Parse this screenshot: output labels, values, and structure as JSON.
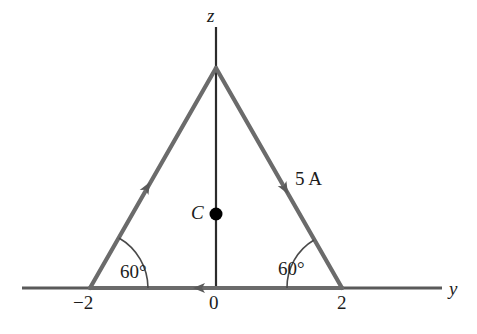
{
  "figure": {
    "background_color": "#ffffff",
    "axes": {
      "vertical": {
        "label": "z",
        "color": "#2b2b2b",
        "x_px": 216,
        "y_top_px": 27,
        "y_bottom_px": 288,
        "width_px": 2
      },
      "horizontal": {
        "label": "y",
        "color": "#5a5a5a",
        "y_px": 288,
        "x_left_px": 22,
        "x_right_px": 442,
        "width_px": 3
      },
      "origin_label": "0"
    },
    "ticks": [
      {
        "label": "−2",
        "x_px": 90
      },
      {
        "label": "0",
        "x_px": 216
      },
      {
        "label": "2",
        "x_px": 342
      }
    ],
    "triangle": {
      "stroke_color": "#6b6b6b",
      "stroke_width_px": 4,
      "apex": {
        "x_px": 216,
        "y_px": 68
      },
      "bottom_left": {
        "x_px": 90,
        "y_px": 288
      },
      "bottom_right": {
        "x_px": 342,
        "y_px": 288
      },
      "side_length_units": 4
    },
    "current": {
      "label": "5 A",
      "value": 5,
      "unit": "A",
      "direction": "clockwise",
      "arrow_color": "#5a5a5a"
    },
    "angles": [
      {
        "label": "60°",
        "value": 60,
        "vertex": "bottom-left"
      },
      {
        "label": "60°",
        "value": 60,
        "vertex": "bottom-right"
      }
    ],
    "center_point": {
      "label": "C",
      "x_px": 216,
      "y_px": 214,
      "radius_px": 6,
      "color": "#000000"
    }
  }
}
